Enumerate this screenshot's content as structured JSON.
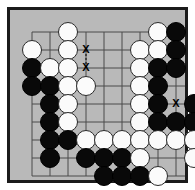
{
  "diagram": {
    "kind": "go-board-position",
    "board": {
      "columns": 10,
      "rows": 9,
      "background_color": "#b9b9b9",
      "line_color": "#4a4a4a",
      "border_color": "#1b1b1b",
      "cell_size": 18,
      "origin_x": 22,
      "origin_y": 22
    },
    "stone_colors": {
      "black": "#090909",
      "white": "#fbfbfb",
      "white_outline": "#2a2a2a"
    },
    "stones": [
      {
        "color": "white",
        "col": 3,
        "row": 1
      },
      {
        "color": "white",
        "col": 8,
        "row": 1
      },
      {
        "color": "black",
        "col": 9,
        "row": 1
      },
      {
        "color": "white",
        "col": 1,
        "row": 2
      },
      {
        "color": "white",
        "col": 3,
        "row": 2
      },
      {
        "color": "white",
        "col": 7,
        "row": 2
      },
      {
        "color": "white",
        "col": 8,
        "row": 2
      },
      {
        "color": "black",
        "col": 9,
        "row": 2
      },
      {
        "color": "black",
        "col": 1,
        "row": 3
      },
      {
        "color": "white",
        "col": 2,
        "row": 3
      },
      {
        "color": "white",
        "col": 3,
        "row": 3
      },
      {
        "color": "white",
        "col": 7,
        "row": 3
      },
      {
        "color": "black",
        "col": 8,
        "row": 3
      },
      {
        "color": "black",
        "col": 9,
        "row": 3
      },
      {
        "color": "black",
        "col": 1,
        "row": 4
      },
      {
        "color": "black",
        "col": 2,
        "row": 4
      },
      {
        "color": "white",
        "col": 3,
        "row": 4
      },
      {
        "color": "white",
        "col": 4,
        "row": 4
      },
      {
        "color": "white",
        "col": 7,
        "row": 4
      },
      {
        "color": "black",
        "col": 8,
        "row": 4
      },
      {
        "color": "black",
        "col": 2,
        "row": 5
      },
      {
        "color": "white",
        "col": 3,
        "row": 5
      },
      {
        "color": "white",
        "col": 7,
        "row": 5
      },
      {
        "color": "black",
        "col": 8,
        "row": 5
      },
      {
        "color": "black",
        "col": 10,
        "row": 5
      },
      {
        "color": "black",
        "col": 2,
        "row": 6
      },
      {
        "color": "white",
        "col": 3,
        "row": 6
      },
      {
        "color": "white",
        "col": 7,
        "row": 6
      },
      {
        "color": "black",
        "col": 8,
        "row": 6
      },
      {
        "color": "black",
        "col": 9,
        "row": 6
      },
      {
        "color": "black",
        "col": 10,
        "row": 6
      },
      {
        "color": "black",
        "col": 2,
        "row": 7
      },
      {
        "color": "black",
        "col": 3,
        "row": 7
      },
      {
        "color": "white",
        "col": 4,
        "row": 7
      },
      {
        "color": "white",
        "col": 5,
        "row": 7
      },
      {
        "color": "white",
        "col": 6,
        "row": 7
      },
      {
        "color": "white",
        "col": 7,
        "row": 7
      },
      {
        "color": "white",
        "col": 8,
        "row": 7
      },
      {
        "color": "white",
        "col": 9,
        "row": 7
      },
      {
        "color": "white",
        "col": 10,
        "row": 7
      },
      {
        "color": "black",
        "col": 2,
        "row": 8
      },
      {
        "color": "black",
        "col": 4,
        "row": 8
      },
      {
        "color": "black",
        "col": 5,
        "row": 8
      },
      {
        "color": "black",
        "col": 6,
        "row": 8
      },
      {
        "color": "white",
        "col": 7,
        "row": 8
      },
      {
        "color": "white",
        "col": 10,
        "row": 8
      },
      {
        "color": "black",
        "col": 5,
        "row": 9
      },
      {
        "color": "black",
        "col": 6,
        "row": 9
      },
      {
        "color": "black",
        "col": 7,
        "row": 9
      },
      {
        "color": "white",
        "col": 8,
        "row": 9
      }
    ],
    "markers": [
      {
        "label": "X",
        "col": 4,
        "row": 2
      },
      {
        "label": "X",
        "col": 4,
        "row": 3
      },
      {
        "label": "X",
        "col": 9,
        "row": 5
      }
    ],
    "marker_connectors": [
      {
        "from_col": 4,
        "from_row": 2,
        "to_col": 4,
        "to_row": 3,
        "style": "dashed"
      }
    ]
  }
}
